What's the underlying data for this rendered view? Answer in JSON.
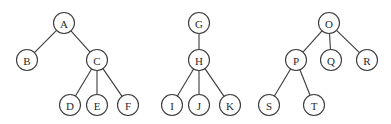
{
  "diagram": {
    "type": "forest",
    "node_radius": 10.5,
    "colors": {
      "stroke": "#3a3a3a",
      "fill": "#ffffff",
      "text": "#2a2a2a"
    },
    "trees": [
      {
        "root": "A",
        "nodes": [
          {
            "id": "A",
            "label": "A",
            "x": 64,
            "y": 23
          },
          {
            "id": "B",
            "label": "B",
            "x": 27,
            "y": 60
          },
          {
            "id": "C",
            "label": "C",
            "x": 97,
            "y": 60
          },
          {
            "id": "D",
            "label": "D",
            "x": 70,
            "y": 105
          },
          {
            "id": "E",
            "label": "E",
            "x": 97,
            "y": 105
          },
          {
            "id": "F",
            "label": "F",
            "x": 128,
            "y": 105
          }
        ],
        "edges": [
          [
            "A",
            "B"
          ],
          [
            "A",
            "C"
          ],
          [
            "C",
            "D"
          ],
          [
            "C",
            "E"
          ],
          [
            "C",
            "F"
          ]
        ]
      },
      {
        "root": "G",
        "nodes": [
          {
            "id": "G",
            "label": "G",
            "x": 199,
            "y": 23
          },
          {
            "id": "H",
            "label": "H",
            "x": 199,
            "y": 60
          },
          {
            "id": "I",
            "label": "I",
            "x": 172,
            "y": 105
          },
          {
            "id": "J",
            "label": "J",
            "x": 199,
            "y": 105
          },
          {
            "id": "K",
            "label": "K",
            "x": 230,
            "y": 105
          }
        ],
        "edges": [
          [
            "G",
            "H"
          ],
          [
            "H",
            "I"
          ],
          [
            "H",
            "J"
          ],
          [
            "H",
            "K"
          ]
        ]
      },
      {
        "root": "O",
        "nodes": [
          {
            "id": "O",
            "label": "O",
            "x": 329,
            "y": 23
          },
          {
            "id": "P",
            "label": "P",
            "x": 296,
            "y": 60
          },
          {
            "id": "Q",
            "label": "Q",
            "x": 331,
            "y": 60
          },
          {
            "id": "R",
            "label": "R",
            "x": 367,
            "y": 60
          },
          {
            "id": "S",
            "label": "S",
            "x": 269,
            "y": 105
          },
          {
            "id": "T",
            "label": "T",
            "x": 314,
            "y": 105
          }
        ],
        "edges": [
          [
            "O",
            "P"
          ],
          [
            "O",
            "Q"
          ],
          [
            "O",
            "R"
          ],
          [
            "P",
            "S"
          ],
          [
            "P",
            "T"
          ]
        ]
      }
    ]
  }
}
